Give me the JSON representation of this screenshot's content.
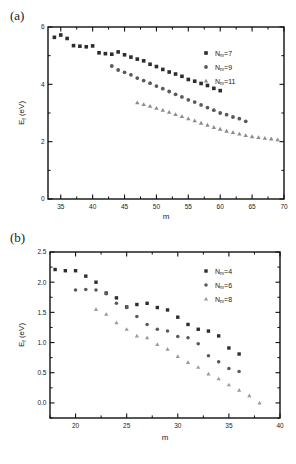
{
  "figure": {
    "panel_a_label": "(a)",
    "panel_b_label": "(b)"
  },
  "chart_data": [
    {
      "id": "panel-a",
      "type": "scatter",
      "title": "(a)",
      "xlabel": "m",
      "ylabel": "E_f (eV)",
      "ylabel_base": "E",
      "ylabel_sub": "f",
      "ylabel_unit": " (eV)",
      "xlim": [
        33,
        70
      ],
      "ylim": [
        0,
        6
      ],
      "xticks": [
        35,
        40,
        45,
        50,
        55,
        60,
        65,
        70
      ],
      "xtick_labels": [
        "35",
        "40",
        "45",
        "50",
        "55",
        "60",
        "65",
        "70"
      ],
      "yticks": [
        0,
        2,
        4,
        6
      ],
      "ytick_labels": [
        "0",
        "2",
        "4",
        "6"
      ],
      "xminor_step": 2.5,
      "yminor_step": 1,
      "grid": false,
      "legend_position": "top-right",
      "series": [
        {
          "name": "N_m=7",
          "label_base": "N",
          "label_sub": "m",
          "label_tail": "=7",
          "marker": "square",
          "color": "#2d2d2d",
          "x": [
            34,
            35,
            36,
            37,
            38,
            39,
            40,
            41,
            42,
            43,
            44,
            45,
            46,
            47,
            48,
            49,
            50,
            51,
            52,
            53,
            54,
            55,
            56,
            57,
            58,
            59,
            60
          ],
          "y": [
            5.64,
            5.72,
            5.6,
            5.35,
            5.33,
            5.31,
            5.34,
            5.1,
            5.07,
            5.05,
            5.13,
            5.03,
            4.95,
            4.88,
            4.82,
            4.7,
            4.62,
            4.52,
            4.43,
            4.36,
            4.28,
            4.17,
            4.11,
            4.03,
            3.96,
            3.86,
            3.78
          ]
        },
        {
          "name": "N_m=9",
          "label_base": "N",
          "label_sub": "m",
          "label_tail": "=9",
          "marker": "circle",
          "color": "#5a5a5a",
          "x": [
            43,
            44,
            45,
            46,
            47,
            48,
            49,
            50,
            51,
            52,
            53,
            54,
            55,
            56,
            57,
            58,
            59,
            60,
            61,
            62,
            63,
            64
          ],
          "y": [
            4.64,
            4.5,
            4.42,
            4.33,
            4.22,
            4.13,
            4.04,
            3.94,
            3.85,
            3.75,
            3.65,
            3.56,
            3.46,
            3.38,
            3.28,
            3.19,
            3.1,
            3.0,
            2.94,
            2.86,
            2.8,
            2.71
          ]
        },
        {
          "name": "N_m=11",
          "label_base": "N",
          "label_sub": "m",
          "label_tail": "=11",
          "marker": "triangle",
          "color": "#8c8c8c",
          "x": [
            47,
            48,
            49,
            50,
            51,
            52,
            53,
            54,
            55,
            56,
            57,
            58,
            59,
            60,
            61,
            62,
            63,
            64,
            65,
            66,
            67,
            68,
            69
          ],
          "y": [
            3.36,
            3.3,
            3.24,
            3.17,
            3.1,
            3.03,
            2.95,
            2.88,
            2.8,
            2.73,
            2.65,
            2.58,
            2.5,
            2.44,
            2.37,
            2.32,
            2.27,
            2.22,
            2.18,
            2.15,
            2.12,
            2.1,
            2.07
          ]
        }
      ]
    },
    {
      "id": "panel-b",
      "type": "scatter",
      "title": "(b)",
      "xlabel": "m",
      "ylabel": "E_f (eV)",
      "ylabel_base": "E",
      "ylabel_sub": "f",
      "ylabel_unit": " (eV)",
      "xlim": [
        17.5,
        40
      ],
      "ylim": [
        -0.25,
        2.5
      ],
      "xticks": [
        20,
        25,
        30,
        35,
        40
      ],
      "xtick_labels": [
        "20",
        "25",
        "30",
        "35",
        "40"
      ],
      "yticks": [
        0.0,
        0.5,
        1.0,
        1.5,
        2.0,
        2.5
      ],
      "ytick_labels": [
        "0.0",
        "0.5",
        "1.0",
        "1.5",
        "2.0",
        "2.5"
      ],
      "xminor_step": 2.5,
      "yminor_step": 0.25,
      "grid": false,
      "legend_position": "top-right",
      "series": [
        {
          "name": "N_m=4",
          "label_base": "N",
          "label_sub": "m",
          "label_tail": "=4",
          "marker": "square",
          "color": "#2d2d2d",
          "x": [
            18,
            19,
            20,
            21,
            22,
            23,
            24,
            25,
            26,
            27,
            28,
            29,
            30,
            31,
            32,
            33,
            34,
            35,
            36
          ],
          "y": [
            2.21,
            2.19,
            2.19,
            2.1,
            2.0,
            1.82,
            1.74,
            1.59,
            1.63,
            1.65,
            1.58,
            1.54,
            1.42,
            1.3,
            1.22,
            1.19,
            1.11,
            0.91,
            0.81
          ]
        },
        {
          "name": "N_m=6",
          "label_base": "N",
          "label_sub": "m",
          "label_tail": "=6",
          "marker": "circle",
          "color": "#5a5a5a",
          "x": [
            20,
            21,
            22,
            23,
            24,
            25,
            26,
            27,
            28,
            29,
            30,
            31,
            32,
            33,
            34,
            35,
            36
          ],
          "y": [
            1.87,
            1.88,
            1.87,
            1.81,
            1.65,
            1.58,
            1.43,
            1.3,
            1.22,
            1.19,
            1.1,
            1.08,
            0.98,
            0.78,
            0.68,
            0.57,
            0.52
          ]
        },
        {
          "name": "N_m=8",
          "label_base": "N",
          "label_sub": "m",
          "label_tail": "=8",
          "marker": "triangle",
          "color": "#9a9a9a",
          "x": [
            22,
            23,
            24,
            25,
            26,
            27,
            28,
            29,
            30,
            31,
            32,
            33,
            34,
            35,
            36,
            37,
            38
          ],
          "y": [
            1.55,
            1.47,
            1.33,
            1.22,
            1.11,
            1.08,
            0.97,
            0.89,
            0.77,
            0.67,
            0.59,
            0.48,
            0.4,
            0.3,
            0.21,
            0.12,
            0.0
          ]
        }
      ]
    }
  ]
}
